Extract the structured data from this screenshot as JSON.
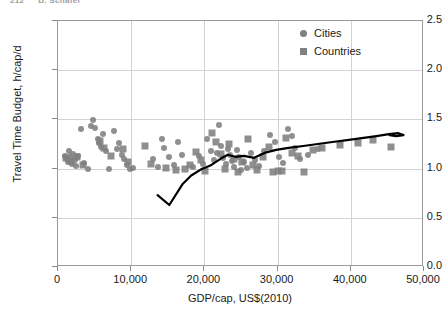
{
  "header": {
    "page_number": "212",
    "running_title": "D. Schäfer"
  },
  "chart_data": {
    "type": "scatter",
    "title": "",
    "xlabel": "GDP/cap, US$(2010)",
    "ylabel": "Travel Time Budget, h/cap/d",
    "xlim": [
      0,
      50000
    ],
    "ylim": [
      0.0,
      2.5
    ],
    "xticks": [
      0,
      10000,
      20000,
      30000,
      40000,
      50000
    ],
    "xtick_labels": [
      "0",
      "10,000",
      "20,000",
      "30,000",
      "40,000",
      "50,000"
    ],
    "yticks": [
      0.0,
      0.5,
      1.0,
      1.5,
      2.0,
      2.5
    ],
    "ytick_labels": [
      "0.0",
      "0.5",
      "1.0",
      "1.5",
      "2.0",
      "2.5"
    ],
    "grid": "horizontal-and-vertical",
    "grid_color": "#d2d2d2",
    "marker_color": "#808080",
    "trendline_color": "#000000",
    "legend": {
      "position": "top-right",
      "entries": [
        {
          "label": "Cities",
          "marker": "circle",
          "color": "#808080"
        },
        {
          "label": "Countries",
          "marker": "square",
          "color": "#808080"
        }
      ]
    },
    "series": [
      {
        "name": "Cities",
        "marker": "circle",
        "color": "#808080",
        "points": [
          [
            900,
            1.13
          ],
          [
            1200,
            1.1
          ],
          [
            1400,
            1.07
          ],
          [
            1500,
            1.18
          ],
          [
            1700,
            1.12
          ],
          [
            1900,
            1.05
          ],
          [
            2100,
            1.15
          ],
          [
            2300,
            1.09
          ],
          [
            2500,
            1.03
          ],
          [
            2700,
            1.13
          ],
          [
            3200,
            1.4
          ],
          [
            3600,
            1.06
          ],
          [
            4100,
            1.0
          ],
          [
            4500,
            1.43
          ],
          [
            4800,
            1.49
          ],
          [
            5100,
            1.41
          ],
          [
            5400,
            1.3
          ],
          [
            5600,
            1.26
          ],
          [
            5900,
            1.22
          ],
          [
            6200,
            1.35
          ],
          [
            6600,
            1.18
          ],
          [
            7000,
            1.0
          ],
          [
            7600,
            1.38
          ],
          [
            8000,
            1.2
          ],
          [
            8400,
            1.26
          ],
          [
            8700,
            1.14
          ],
          [
            9000,
            1.1
          ],
          [
            9400,
            1.04
          ],
          [
            9800,
            1.0
          ],
          [
            10200,
            1.01
          ],
          [
            13000,
            1.1
          ],
          [
            13600,
            1.02
          ],
          [
            14200,
            1.3
          ],
          [
            14500,
            1.21
          ],
          [
            15200,
            1.12
          ],
          [
            15800,
            1.04
          ],
          [
            16400,
            1.27
          ],
          [
            17000,
            1.14
          ],
          [
            18500,
            1.02
          ],
          [
            19200,
            1.13
          ],
          [
            19800,
            1.05
          ],
          [
            20400,
            1.3
          ],
          [
            20900,
            1.18
          ],
          [
            21300,
            1.09
          ],
          [
            21700,
            1.16
          ],
          [
            22000,
            1.44
          ],
          [
            22300,
            1.23
          ],
          [
            22600,
            1.11
          ],
          [
            22900,
            1.05
          ],
          [
            23200,
            1.2
          ],
          [
            23500,
            1.14
          ],
          [
            23800,
            1.08
          ],
          [
            24100,
            1.02
          ],
          [
            24400,
            1.19
          ],
          [
            24700,
            1.12
          ],
          [
            25000,
            0.99
          ],
          [
            25400,
            1.07
          ],
          [
            25800,
            1.01
          ],
          [
            26300,
            1.16
          ],
          [
            26900,
            1.09
          ],
          [
            27500,
            1.03
          ],
          [
            28200,
            1.18
          ],
          [
            29000,
            1.34
          ],
          [
            29600,
            1.27
          ],
          [
            30200,
            1.12
          ],
          [
            30800,
            1.06
          ],
          [
            31400,
            1.4
          ],
          [
            31900,
            1.33
          ],
          [
            32400,
            1.21
          ],
          [
            33000,
            1.1
          ],
          [
            34200,
            1.14
          ],
          [
            35500,
            1.2
          ]
        ]
      },
      {
        "name": "Countries",
        "marker": "square",
        "color": "#808080",
        "points": [
          [
            1100,
            1.11
          ],
          [
            1800,
            1.08
          ],
          [
            2600,
            1.12
          ],
          [
            3400,
            1.04
          ],
          [
            5700,
            1.28
          ],
          [
            6300,
            1.21
          ],
          [
            7200,
            1.13
          ],
          [
            8900,
            1.2
          ],
          [
            9600,
            1.07
          ],
          [
            11900,
            1.23
          ],
          [
            12700,
            1.05
          ],
          [
            14800,
            1.01
          ],
          [
            16100,
            0.99
          ],
          [
            17300,
            1.0
          ],
          [
            18000,
            1.04
          ],
          [
            18900,
            1.17
          ],
          [
            19500,
            1.09
          ],
          [
            20100,
            0.98
          ],
          [
            21000,
            1.36
          ],
          [
            21600,
            1.27
          ],
          [
            22200,
            1.15
          ],
          [
            22800,
            1.0
          ],
          [
            23400,
            1.25
          ],
          [
            24000,
            1.1
          ],
          [
            24600,
            0.97
          ],
          [
            25200,
            1.07
          ],
          [
            26000,
            1.3
          ],
          [
            26600,
            1.04
          ],
          [
            27200,
            0.99
          ],
          [
            28000,
            1.12
          ],
          [
            28800,
            1.22
          ],
          [
            29400,
            0.97
          ],
          [
            30000,
            0.98
          ],
          [
            30600,
            0.98
          ],
          [
            31200,
            1.31
          ],
          [
            32000,
            1.16
          ],
          [
            32800,
            1.13
          ],
          [
            33600,
            0.97
          ],
          [
            34800,
            1.19
          ],
          [
            36000,
            1.21
          ],
          [
            38500,
            1.24
          ],
          [
            41000,
            1.26
          ],
          [
            43000,
            1.29
          ],
          [
            45500,
            1.22
          ]
        ]
      }
    ],
    "trendline": {
      "name": "fitted trend",
      "style": "solid",
      "width": 2,
      "points": [
        [
          13600,
          0.73
        ],
        [
          15200,
          0.63
        ],
        [
          17000,
          0.84
        ],
        [
          18200,
          0.93
        ],
        [
          19500,
          0.99
        ],
        [
          20800,
          1.03
        ],
        [
          22200,
          1.1
        ],
        [
          23200,
          1.14
        ],
        [
          24200,
          1.12
        ],
        [
          25400,
          1.13
        ],
        [
          26800,
          1.11
        ],
        [
          28200,
          1.16
        ],
        [
          29800,
          1.19
        ],
        [
          31500,
          1.21
        ],
        [
          33500,
          1.23
        ],
        [
          35500,
          1.25
        ],
        [
          37500,
          1.27
        ],
        [
          39500,
          1.29
        ],
        [
          41500,
          1.31
        ],
        [
          43500,
          1.33
        ],
        [
          45200,
          1.35
        ],
        [
          46500,
          1.36
        ],
        [
          47200,
          1.34
        ],
        [
          46200,
          1.33
        ],
        [
          45300,
          1.34
        ]
      ]
    }
  }
}
